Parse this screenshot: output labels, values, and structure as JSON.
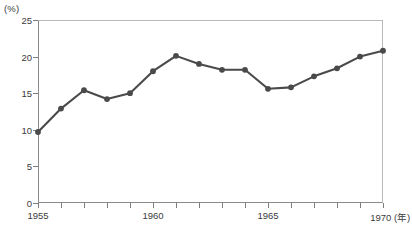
{
  "chart_data": {
    "type": "line",
    "title": "",
    "xlabel": "年",
    "ylabel": "%",
    "unit_label": "(%)",
    "x_axis_suffix_label": "1970 (年)",
    "grid": true,
    "legend": "none",
    "xlim": [
      1955,
      1970
    ],
    "ylim": [
      0,
      25
    ],
    "y_tick_labels": [
      "0",
      "5",
      "10",
      "15",
      "20",
      "25"
    ],
    "y_tick_values": [
      0,
      5,
      10,
      15,
      20,
      25
    ],
    "y_gridline_values": [
      5,
      10,
      15,
      20
    ],
    "x_tick_values": [
      1955,
      1956,
      1957,
      1958,
      1959,
      1960,
      1961,
      1962,
      1963,
      1964,
      1965,
      1966,
      1967,
      1968,
      1969,
      1970
    ],
    "x_tick_labels_shown": [
      {
        "value": 1955,
        "label": "1955"
      },
      {
        "value": 1960,
        "label": "1960"
      },
      {
        "value": 1965,
        "label": "1965"
      },
      {
        "value": 1970,
        "label": "1970 (年)"
      }
    ],
    "x": [
      1955,
      1956,
      1957,
      1958,
      1959,
      1960,
      1961,
      1962,
      1963,
      1964,
      1965,
      1966,
      1967,
      1968,
      1969,
      1970
    ],
    "values": [
      9.7,
      12.9,
      15.4,
      14.2,
      15.0,
      18.0,
      20.1,
      19.0,
      18.2,
      18.2,
      15.6,
      15.8,
      17.3,
      18.4,
      20.0,
      20.8
    ],
    "series": [
      {
        "name": "",
        "color": "#4a4a4a",
        "marker": "circle",
        "values": [
          9.7,
          12.9,
          15.4,
          14.2,
          15.0,
          18.0,
          20.1,
          19.0,
          18.2,
          18.2,
          15.6,
          15.8,
          17.3,
          18.4,
          20.0,
          20.8
        ]
      }
    ]
  },
  "colors": {
    "line": "#4a4a4a",
    "marker": "#4a4a4a",
    "grid": "#9a9a9a",
    "axis": "#8a8a8a",
    "frame_light": "#b9b9b9",
    "text": "#3b3b3b",
    "background": "#ffffff"
  }
}
